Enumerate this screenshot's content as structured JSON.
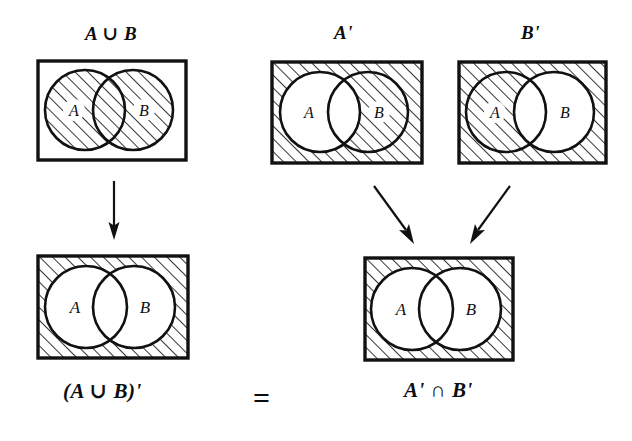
{
  "figure": {
    "type": "venn-diagram-proof",
    "ink_color": "#111111",
    "page_background": "#ffffff",
    "hatch": {
      "angle_deg": 45,
      "spacing_px": 9,
      "stroke_width_px": 1.6,
      "color": "#111111"
    }
  },
  "diagrams": [
    {
      "id": "a-union-b",
      "caption": "A ∪ B",
      "caption_position": "top",
      "shaded_region": "A ∪ B",
      "set_labels": {
        "left": "A",
        "right": "B"
      },
      "rect": {
        "x": 38,
        "y": 61,
        "w": 148,
        "h": 99
      },
      "circle_left": {
        "cx": 85,
        "cy": 110,
        "r": 40
      },
      "circle_right": {
        "cx": 133,
        "cy": 110,
        "r": 40
      }
    },
    {
      "id": "a-prime",
      "caption": "A'",
      "caption_position": "top",
      "shaded_region": "complement of A",
      "set_labels": {
        "left": "A",
        "right": "B"
      },
      "rect": {
        "x": 272,
        "y": 62,
        "w": 150,
        "h": 101
      },
      "circle_left": {
        "cx": 320,
        "cy": 112,
        "r": 40
      },
      "circle_right": {
        "cx": 368,
        "cy": 112,
        "r": 40
      }
    },
    {
      "id": "b-prime",
      "caption": "B'",
      "caption_position": "top",
      "shaded_region": "complement of B",
      "set_labels": {
        "left": "A",
        "right": "B"
      },
      "rect": {
        "x": 459,
        "y": 62,
        "w": 147,
        "h": 101
      },
      "circle_left": {
        "cx": 506,
        "cy": 112,
        "r": 40
      },
      "circle_right": {
        "cx": 554,
        "cy": 112,
        "r": 40
      }
    },
    {
      "id": "a-union-b-prime",
      "caption": "(A ∪ B)'",
      "caption_position": "bottom",
      "shaded_region": "complement of A ∪ B",
      "set_labels": {
        "left": "A",
        "right": "B"
      },
      "rect": {
        "x": 38,
        "y": 256,
        "w": 150,
        "h": 102
      },
      "circle_left": {
        "cx": 86,
        "cy": 307,
        "r": 41
      },
      "circle_right": {
        "cx": 134,
        "cy": 307,
        "r": 41
      }
    },
    {
      "id": "a-prime-inter-b-prime",
      "caption": "A' ∩ B'",
      "caption_position": "bottom",
      "shaded_region": "intersection of complements",
      "set_labels": {
        "left": "A",
        "right": "B"
      },
      "rect": {
        "x": 365,
        "y": 258,
        "w": 148,
        "h": 102
      },
      "circle_left": {
        "cx": 412,
        "cy": 309,
        "r": 41
      },
      "circle_right": {
        "cx": 460,
        "cy": 309,
        "r": 41
      }
    }
  ],
  "arrows": [
    {
      "id": "arrow-down-left",
      "from": "a-union-b",
      "to": "a-union-b-prime",
      "x1": 113,
      "y1": 183,
      "x2": 113,
      "y2": 240
    },
    {
      "id": "arrow-diagonal-left",
      "from": "a-prime",
      "to": "a-prime-inter-b-prime",
      "x1": 378,
      "y1": 186,
      "x2": 410,
      "y2": 243
    },
    {
      "id": "arrow-diagonal-right",
      "from": "b-prime",
      "to": "a-prime-inter-b-prime",
      "x1": 503,
      "y1": 186,
      "x2": 471,
      "y2": 243
    }
  ],
  "relation": {
    "symbol": "=",
    "left_operand": "(A ∪ B)'",
    "right_operand": "A' ∩ B'",
    "x": 255,
    "y": 388
  },
  "captions": {
    "a_union_b": "A ∪ B",
    "a_prime": "A'",
    "b_prime": "B'",
    "a_union_b_prime": "(A ∪ B)'",
    "a_prime_inter_b_prime": "A' ∩ B'",
    "equals": "="
  },
  "set_letters": {
    "a": "A",
    "b": "B"
  }
}
